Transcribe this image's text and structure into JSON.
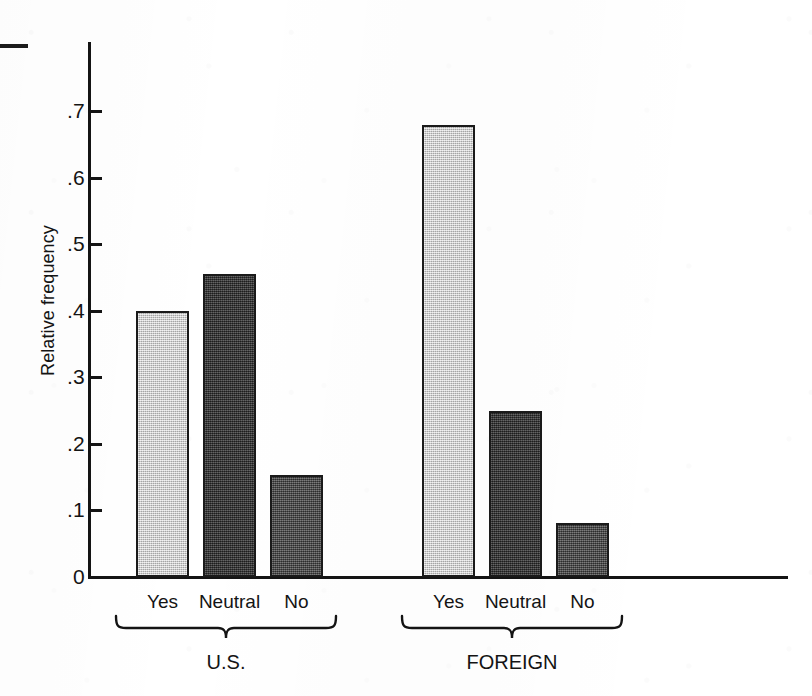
{
  "chart_data": {
    "type": "bar",
    "title": "",
    "xlabel": "",
    "ylabel": "Relative frequency",
    "ylim": [
      0,
      0.78
    ],
    "grid": false,
    "legend": "none",
    "y_ticks": [
      "0",
      ".1",
      ".2",
      ".3",
      ".4",
      ".5",
      ".6",
      ".7"
    ],
    "y_tick_values": [
      0,
      0.1,
      0.2,
      0.3,
      0.4,
      0.5,
      0.6,
      0.7
    ],
    "categories": [
      "Yes",
      "Neutral",
      "No"
    ],
    "groups": [
      "U.S.",
      "FOREIGN"
    ],
    "series": [
      {
        "name": "U.S.",
        "values": [
          0.4,
          0.455,
          0.153
        ]
      },
      {
        "name": "FOREIGN",
        "values": [
          0.678,
          0.249,
          0.082
        ]
      }
    ],
    "bars": [
      {
        "group": "U.S.",
        "category": "Yes",
        "value": 0.4,
        "shade": "light"
      },
      {
        "group": "U.S.",
        "category": "Neutral",
        "value": 0.455,
        "shade": "darkest"
      },
      {
        "group": "U.S.",
        "category": "No",
        "value": 0.153,
        "shade": "mid"
      },
      {
        "group": "FOREIGN",
        "category": "Yes",
        "value": 0.678,
        "shade": "light"
      },
      {
        "group": "FOREIGN",
        "category": "Neutral",
        "value": 0.249,
        "shade": "darkest"
      },
      {
        "group": "FOREIGN",
        "category": "No",
        "value": 0.082,
        "shade": "mid"
      }
    ],
    "colors": {
      "light": "#cacaca",
      "darkest": "#3a3a3a",
      "mid": "#4b4b4b",
      "axis": "#141414",
      "background": "#ffffff"
    }
  },
  "axis": {
    "y": {
      "t0": "0",
      "t1": ".1",
      "t2": ".2",
      "t3": ".3",
      "t4": ".4",
      "t5": ".5",
      "t6": ".6",
      "t7": ".7",
      "label": "Relative frequency"
    }
  },
  "us_group": {
    "label": "U.S.",
    "cat_yes": "Yes",
    "cat_neutral": "Neutral",
    "cat_no": "No"
  },
  "foreign_group": {
    "label": "FOREIGN",
    "cat_yes": "Yes",
    "cat_neutral": "Neutral",
    "cat_no": "No"
  }
}
